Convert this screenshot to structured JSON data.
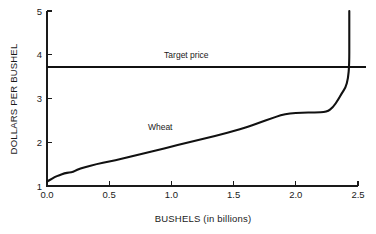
{
  "chart_data": {
    "type": "line",
    "title": "",
    "subtitle": "",
    "xlabel": "BUSHELS (in billions)",
    "ylabel": "DOLLARS PER BUSHEL",
    "xlim": [
      0.0,
      2.5
    ],
    "ylim": [
      1,
      5
    ],
    "xticks": [
      "0.0",
      "0.5",
      "1.0",
      "1.5",
      "2.0",
      "2.5"
    ],
    "xtick_values": [
      0.0,
      0.5,
      1.0,
      1.5,
      2.0,
      2.5
    ],
    "yticks": [
      "1",
      "2",
      "3",
      "4",
      "5"
    ],
    "ytick_values": [
      1,
      2,
      3,
      4,
      5
    ],
    "grid": false,
    "legend": "none",
    "series": [
      {
        "name": "Wheat",
        "kind": "supply-curve",
        "label_text": "Wheat",
        "label_x": 0.91,
        "label_y": 2.28,
        "points": [
          [
            0.0,
            1.1
          ],
          [
            0.03,
            1.15
          ],
          [
            0.06,
            1.2
          ],
          [
            0.1,
            1.25
          ],
          [
            0.14,
            1.29
          ],
          [
            0.18,
            1.31
          ],
          [
            0.21,
            1.32
          ],
          [
            0.24,
            1.37
          ],
          [
            0.3,
            1.43
          ],
          [
            0.4,
            1.5
          ],
          [
            0.5,
            1.56
          ],
          [
            0.6,
            1.62
          ],
          [
            0.7,
            1.69
          ],
          [
            0.8,
            1.76
          ],
          [
            0.9,
            1.83
          ],
          [
            1.0,
            1.9
          ],
          [
            1.1,
            1.97
          ],
          [
            1.2,
            2.04
          ],
          [
            1.3,
            2.11
          ],
          [
            1.4,
            2.18
          ],
          [
            1.5,
            2.25
          ],
          [
            1.6,
            2.34
          ],
          [
            1.7,
            2.44
          ],
          [
            1.8,
            2.54
          ],
          [
            1.88,
            2.62
          ],
          [
            1.95,
            2.66
          ],
          [
            2.05,
            2.68
          ],
          [
            2.15,
            2.68
          ],
          [
            2.25,
            2.69
          ],
          [
            2.3,
            2.8
          ],
          [
            2.34,
            2.97
          ],
          [
            2.37,
            3.12
          ],
          [
            2.4,
            3.25
          ],
          [
            2.42,
            3.45
          ],
          [
            2.43,
            3.78
          ],
          [
            2.43,
            4.3
          ],
          [
            2.43,
            5.0
          ]
        ]
      },
      {
        "name": "Target price",
        "kind": "horizontal-reference-line",
        "label_text": "Target price",
        "value": 3.73,
        "label_x": 1.12,
        "label_y": 3.92
      }
    ]
  },
  "axes": {
    "x_axis_title": "BUSHELS (in billions)",
    "y_axis_title": "DOLLARS PER BUSHEL"
  },
  "annotations": {
    "target_price_label": "Target price",
    "wheat_label": "Wheat"
  },
  "colors": {
    "curve": "#111111",
    "axis": "#1a1a1a",
    "background": "#ffffff"
  }
}
